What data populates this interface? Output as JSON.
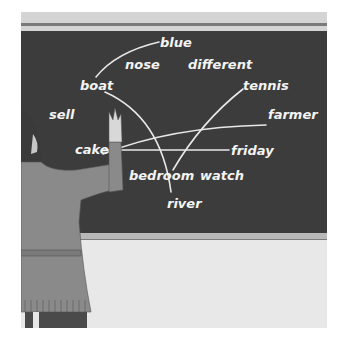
{
  "scene": {
    "description": "Illustration of a girl drawing lines between words on a chalkboard",
    "colors": {
      "board": "#3c3c3c",
      "chalk": "#f4f4f4",
      "wall": "#e8e8e8",
      "rail": "#b8b8b8"
    }
  },
  "board": {
    "words": [
      {
        "text": "blue"
      },
      {
        "text": "nose"
      },
      {
        "text": "different"
      },
      {
        "text": "boat"
      },
      {
        "text": "tennis"
      },
      {
        "text": "sell"
      },
      {
        "text": "farmer"
      },
      {
        "text": "cake"
      },
      {
        "text": "friday"
      },
      {
        "text": "bedroom"
      },
      {
        "text": "watch"
      },
      {
        "text": "river"
      }
    ],
    "connections": [
      {
        "from": "boat",
        "to": "blue"
      },
      {
        "from": "boat",
        "to": "river"
      },
      {
        "from": "cake",
        "to": "farmer"
      },
      {
        "from": "cake",
        "to": "friday"
      },
      {
        "from": "bedroom",
        "to": "tennis"
      }
    ]
  }
}
